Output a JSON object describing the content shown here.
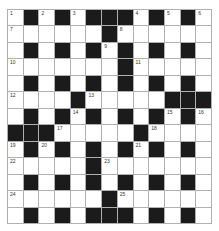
{
  "puzzle": {
    "rows": 13,
    "cols": 13,
    "colors": {
      "block": "#1b1b1b",
      "cell": "#ffffff",
      "gridline": "#b0b0b0",
      "number": "#333333"
    },
    "grid": [
      [
        "1",
        "#",
        "2",
        "#",
        "3",
        "#",
        "#",
        "#",
        "4",
        "#",
        "5",
        "#",
        "6"
      ],
      [
        "7",
        ".",
        ".",
        ".",
        ".",
        ".",
        "#",
        "8",
        ".",
        ".",
        ".",
        ".",
        "."
      ],
      [
        ".",
        "#",
        ".",
        "#",
        ".",
        "#",
        "9",
        "#",
        ".",
        "#",
        ".",
        "#",
        "."
      ],
      [
        "10",
        ".",
        ".",
        ".",
        ".",
        ".",
        ".",
        "#",
        "11",
        ".",
        ".",
        ".",
        "."
      ],
      [
        ".",
        "#",
        ".",
        "#",
        ".",
        "#",
        ".",
        "#",
        ".",
        "#",
        ".",
        "#",
        "."
      ],
      [
        "12",
        ".",
        ".",
        ".",
        "#",
        "13",
        ".",
        ".",
        ".",
        ".",
        "#",
        "#",
        "#"
      ],
      [
        ".",
        "#",
        ".",
        "#",
        "14",
        "#",
        ".",
        "#",
        ".",
        "#",
        "15",
        "#",
        "16"
      ],
      [
        "#",
        "#",
        "#",
        "17",
        ".",
        ".",
        ".",
        ".",
        "#",
        "18",
        ".",
        ".",
        "."
      ],
      [
        "19",
        "#",
        "20",
        "#",
        ".",
        "#",
        ".",
        "#",
        "21",
        "#",
        ".",
        "#",
        "."
      ],
      [
        "22",
        ".",
        ".",
        ".",
        ".",
        "#",
        "23",
        ".",
        ".",
        ".",
        ".",
        ".",
        "."
      ],
      [
        ".",
        "#",
        ".",
        "#",
        ".",
        "#",
        ".",
        "#",
        ".",
        "#",
        ".",
        "#",
        "."
      ],
      [
        "24",
        ".",
        ".",
        ".",
        ".",
        ".",
        "#",
        "25",
        ".",
        ".",
        ".",
        ".",
        "."
      ],
      [
        ".",
        "#",
        ".",
        "#",
        ".",
        "#",
        "#",
        "#",
        ".",
        "#",
        ".",
        "#",
        "."
      ]
    ],
    "legend": {
      "#": "black block",
      ".": "empty white cell",
      "number": "white cell with clue number"
    }
  }
}
